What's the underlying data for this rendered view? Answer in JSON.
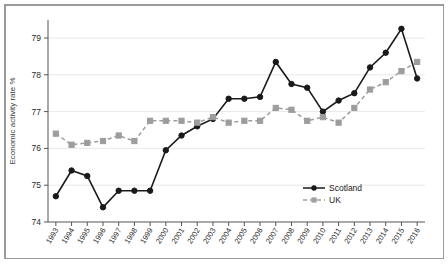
{
  "chart_data": {
    "type": "line",
    "title": "",
    "subtitle": "",
    "xlabel": "",
    "ylabel": "Economic activity rate %",
    "xlim": [
      1993,
      2016
    ],
    "ylim": [
      74,
      79.5
    ],
    "yticks": [
      74,
      75,
      76,
      77,
      78,
      79
    ],
    "ytick_labels": [
      "74",
      "75",
      "76",
      "77",
      "78",
      "79"
    ],
    "grid": true,
    "grid_axis": "y",
    "legend_position": "bottom-right",
    "x": [
      1993,
      1994,
      1995,
      1996,
      1997,
      1998,
      1999,
      2000,
      2001,
      2002,
      2003,
      2004,
      2005,
      2006,
      2007,
      2008,
      2009,
      2010,
      2011,
      2012,
      2013,
      2014,
      2015,
      2016
    ],
    "categories": [
      "1993",
      "1994",
      "1995",
      "1996",
      "1997",
      "1998",
      "1999",
      "2000",
      "2001",
      "2002",
      "2003",
      "2004",
      "2005",
      "2006",
      "2007",
      "2008",
      "2009",
      "2010",
      "2011",
      "2012",
      "2013",
      "2014",
      "2015",
      "2016"
    ],
    "series": [
      {
        "name": "Scotland",
        "color": "#1a1a1a",
        "marker": "circle",
        "linestyle": "solid",
        "values": [
          74.7,
          75.4,
          75.25,
          74.4,
          74.85,
          74.85,
          74.85,
          75.95,
          76.35,
          76.6,
          76.8,
          77.35,
          77.35,
          77.4,
          78.35,
          77.75,
          77.65,
          77.0,
          77.3,
          77.5,
          78.2,
          78.6,
          79.25,
          77.9
        ]
      },
      {
        "name": "UK",
        "color": "#9d9d9d",
        "marker": "square",
        "linestyle": "dashed",
        "values": [
          76.4,
          76.1,
          76.15,
          76.2,
          76.35,
          76.2,
          76.75,
          76.75,
          76.75,
          76.7,
          76.85,
          76.7,
          76.75,
          76.75,
          77.1,
          77.05,
          76.75,
          76.85,
          76.7,
          77.1,
          77.6,
          77.8,
          78.1,
          78.35
        ]
      }
    ]
  },
  "legend": {
    "items": [
      {
        "label": "Scotland",
        "color": "#1a1a1a",
        "marker": "circle",
        "linestyle": "solid"
      },
      {
        "label": "UK",
        "color": "#9d9d9d",
        "marker": "square",
        "linestyle": "dashed"
      }
    ]
  }
}
